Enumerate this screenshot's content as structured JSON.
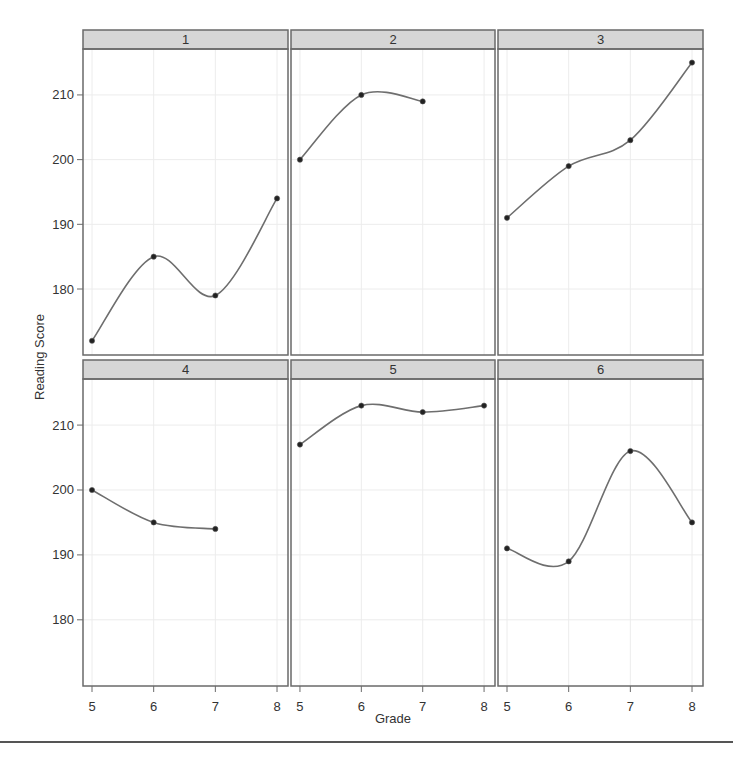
{
  "chart_data": {
    "type": "line",
    "title": "",
    "xlabel": "Grade",
    "ylabel": "Reading Score",
    "layout": {
      "rows": 2,
      "cols": 3
    },
    "xlim": [
      4.854,
      8.178
    ],
    "ylim": [
      169.8,
      217.1
    ],
    "x_ticks": [
      5,
      6,
      7,
      8
    ],
    "y_ticks": [
      180,
      190,
      200,
      210
    ],
    "grid": true,
    "smooth": true,
    "panels": [
      {
        "label": "1",
        "x": [
          5,
          6,
          7,
          8
        ],
        "y": [
          172,
          185,
          179,
          194
        ]
      },
      {
        "label": "2",
        "x": [
          5,
          6,
          7
        ],
        "y": [
          200,
          210,
          209
        ]
      },
      {
        "label": "3",
        "x": [
          5,
          6,
          7,
          8
        ],
        "y": [
          191,
          199,
          203,
          215
        ]
      },
      {
        "label": "4",
        "x": [
          5,
          6,
          7
        ],
        "y": [
          200,
          195,
          194
        ]
      },
      {
        "label": "5",
        "x": [
          5,
          6,
          7,
          8
        ],
        "y": [
          207,
          213,
          212,
          213
        ]
      },
      {
        "label": "6",
        "x": [
          5,
          6,
          7,
          8
        ],
        "y": [
          191,
          189,
          206,
          195
        ]
      }
    ],
    "colors": {
      "line": "#6e6e6e",
      "point": "#222222",
      "strip": "#d6d6d6",
      "border": "#6a6a6a",
      "grid": "#ececec",
      "text": "#333333"
    }
  }
}
